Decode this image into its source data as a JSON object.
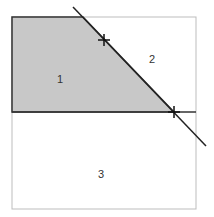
{
  "diagram": {
    "type": "region-partition",
    "outer_box": {
      "x1": 12,
      "y1": 17,
      "x2": 196,
      "y2": 209,
      "stroke": "#bdbdbd"
    },
    "shaded_region": {
      "label": "1",
      "fill": "#c8c8c8",
      "stroke": "#333333",
      "points": [
        [
          12,
          17
        ],
        [
          83,
          17
        ],
        [
          174,
          112
        ],
        [
          12,
          112
        ]
      ]
    },
    "horizontal_line": {
      "x1": 12,
      "y1": 112,
      "x2": 196,
      "y2": 112,
      "stroke": "#333333"
    },
    "diagonal_line": {
      "x1": 73,
      "y1": 7,
      "x2": 206,
      "y2": 146,
      "stroke": "#222222"
    },
    "markers": [
      {
        "name": "cross-marker-upper",
        "x": 104,
        "y": 40
      },
      {
        "name": "cross-marker-lower",
        "x": 174,
        "y": 112
      }
    ],
    "labels": [
      {
        "id": "region-1",
        "text": "1",
        "x": 60,
        "y": 83
      },
      {
        "id": "region-2",
        "text": "2",
        "x": 152,
        "y": 63
      },
      {
        "id": "region-3",
        "text": "3",
        "x": 101,
        "y": 178
      }
    ]
  }
}
